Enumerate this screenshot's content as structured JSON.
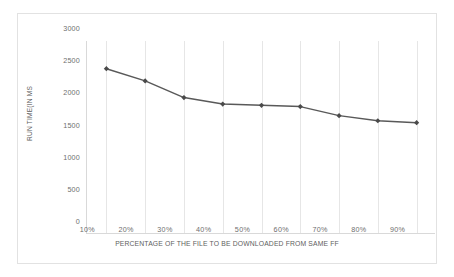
{
  "chart_data": {
    "type": "line",
    "title": "",
    "xlabel": "PERCENTAGE OF THE FILE TO BE DOWNLOADED FROM SAME FF",
    "ylabel": "RUN TIME(IN MS",
    "categories": [
      "10%",
      "20%",
      "30%",
      "40%",
      "50%",
      "60%",
      "70%",
      "80%",
      "90%"
    ],
    "values": [
      2570,
      2380,
      2120,
      2020,
      2000,
      1980,
      1840,
      1760,
      1730
    ],
    "ylim": [
      0,
      3000
    ],
    "yticks": [
      0,
      500,
      1000,
      1500,
      2000,
      2500,
      3000
    ],
    "ytick_labels": [
      "0",
      "500",
      "1000",
      "1500",
      "2000",
      "2500",
      "3000"
    ],
    "grid": "vertical-only",
    "legend": "none",
    "series": [
      {
        "name": "Run time",
        "values": [
          2570,
          2380,
          2120,
          2020,
          2000,
          1980,
          1840,
          1760,
          1730
        ],
        "line_color": "#595959",
        "marker": "diamond"
      }
    ]
  },
  "colors": {
    "series_line": "#595959",
    "marker": "#4a4a4a",
    "grid": "#e6e6e6",
    "axis": "#d9d9d9",
    "border": "#e2e2e2",
    "tick_text": "#6e6e6e",
    "title_text": "#5e5e5e",
    "background": "#ffffff"
  }
}
